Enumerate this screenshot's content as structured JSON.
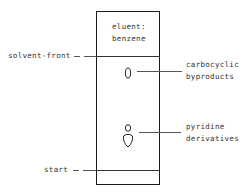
{
  "diagram": {
    "type": "thin-layer chromatography plate",
    "eluent_label": [
      "eluent:",
      "benzene"
    ],
    "markers": {
      "solvent_front": "solvent-front",
      "start": "start"
    },
    "spots": [
      {
        "label_lines": [
          "carbocyclic",
          "byproducts"
        ],
        "shape": "single oval spot near solvent front"
      },
      {
        "label_lines": [
          "pyridine",
          "derivatives"
        ],
        "shape": "small spot above larger spot"
      }
    ]
  }
}
